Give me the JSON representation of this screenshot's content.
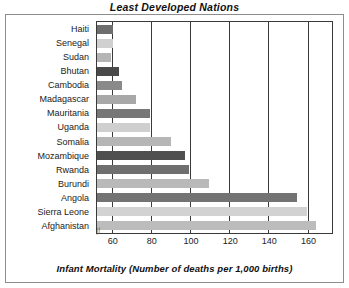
{
  "chart_data": {
    "type": "bar",
    "orientation": "horizontal",
    "title": "Least Developed Nations",
    "xlabel": "Infant Mortality (Number of deaths per 1,000 births)",
    "ylabel": "",
    "xlim": [
      52,
      172
    ],
    "axis_break": true,
    "grid": true,
    "legend": null,
    "xticks": [
      60,
      80,
      100,
      120,
      140,
      160
    ],
    "xtick_labels": [
      "60",
      "80",
      "100",
      "120",
      "140",
      "160"
    ],
    "categories": [
      "Haiti",
      "Senegal",
      "Sudan",
      "Bhutan",
      "Cambodia",
      "Madagascar",
      "Mauritania",
      "Uganda",
      "Somalia",
      "Mozambique",
      "Rwanda",
      "Burundi",
      "Angola",
      "Sierra Leone",
      "Afghanistan"
    ],
    "values": [
      60,
      60,
      59,
      63,
      65,
      72,
      79,
      79,
      90,
      97,
      99,
      109,
      154,
      159,
      164
    ],
    "bar_colors": [
      "#6e6e6e",
      "#d0d0d0",
      "#b5b5b5",
      "#4a4a4a",
      "#8a8a8a",
      "#a8a8a8",
      "#777777",
      "#cfcfcf",
      "#b6b6b6",
      "#4f4f4f",
      "#6f6f6f",
      "#b9b9b9",
      "#737373",
      "#d2d2d2",
      "#bcbcbc"
    ]
  },
  "axis_break_glyph": "//",
  "colors": {
    "frame": "#8d8d8d",
    "plot_border": "#3a3a3a",
    "gridline": "#3a3a3a",
    "text": "#1a1a1a",
    "background": "#ffffff"
  }
}
